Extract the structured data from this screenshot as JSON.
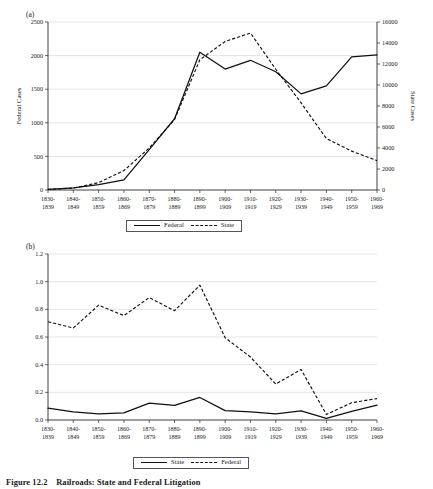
{
  "figure": {
    "caption_number": "Figure 12.2",
    "caption_text": "Railroads: State and Federal Litigation",
    "panel_a_label": "(a)",
    "panel_b_label": "(b)"
  },
  "chart_data": [
    {
      "id": "panel-a",
      "type": "line",
      "title": "",
      "panel": "(a)",
      "xlabel": "",
      "ylabel": "Federal Cases",
      "y2label": "State Cases",
      "grid": true,
      "legend_position": "bottom",
      "categories": [
        "1830-1839",
        "1840-1849",
        "1850-1859",
        "1860-1869",
        "1870-1879",
        "1880-1889",
        "1890-1899",
        "1900-1909",
        "1910-1919",
        "1920-1929",
        "1930-1939",
        "1940-1949",
        "1950-1959",
        "1960-1969"
      ],
      "category_lines": [
        [
          "1830-",
          "1839"
        ],
        [
          "1840-",
          "1849"
        ],
        [
          "1850-",
          "1859"
        ],
        [
          "1860-",
          "1869"
        ],
        [
          "1870-",
          "1879"
        ],
        [
          "1880-",
          "1889"
        ],
        [
          "1890-",
          "1899"
        ],
        [
          "1900-",
          "1909"
        ],
        [
          "1910-",
          "1919"
        ],
        [
          "1920-",
          "1929"
        ],
        [
          "1930-",
          "1939"
        ],
        [
          "1940-",
          "1949"
        ],
        [
          "1950-",
          "1959"
        ],
        [
          "1960-",
          "1969"
        ]
      ],
      "ylim": [
        0,
        2500
      ],
      "yticks": [
        0,
        500,
        1000,
        1500,
        2000,
        2500
      ],
      "ytick_labels": [
        "0",
        "500",
        "1000",
        "1500",
        "2000",
        "2500"
      ],
      "y2lim": [
        0,
        16000
      ],
      "y2ticks": [
        0,
        2000,
        4000,
        6000,
        8000,
        10000,
        12000,
        14000,
        16000
      ],
      "y2tick_labels": [
        "0",
        "2000",
        "4000",
        "6000",
        "8000",
        "10000",
        "12000",
        "14000",
        "16000"
      ],
      "series": [
        {
          "name": "Federal",
          "style": "solid",
          "axis": "left",
          "values": [
            10,
            30,
            80,
            150,
            600,
            1060,
            2050,
            1800,
            1930,
            1760,
            1430,
            1550,
            1980,
            2010
          ]
        },
        {
          "name": "State",
          "style": "dashed",
          "axis": "right",
          "values": [
            60,
            180,
            700,
            1850,
            4000,
            6700,
            12400,
            14150,
            14950,
            11500,
            8300,
            4900,
            3700,
            2800
          ]
        }
      ],
      "legend": [
        {
          "label": "Federal",
          "style": "solid"
        },
        {
          "label": "State",
          "style": "dashed"
        }
      ]
    },
    {
      "id": "panel-b",
      "type": "line",
      "title": "",
      "panel": "(b)",
      "xlabel": "",
      "ylabel": "",
      "grid": true,
      "legend_position": "bottom",
      "categories": [
        "1830-1839",
        "1840-1849",
        "1850-1859",
        "1860-1869",
        "1870-1879",
        "1880-1889",
        "1890-1899",
        "1900-1909",
        "1910-1919",
        "1920-1929",
        "1930-1939",
        "1940-1949",
        "1950-1959",
        "1960-1969"
      ],
      "category_lines": [
        [
          "1830-",
          "1839"
        ],
        [
          "1840-",
          "1849"
        ],
        [
          "1850-",
          "1859"
        ],
        [
          "1860-",
          "1869"
        ],
        [
          "1870-",
          "1879"
        ],
        [
          "1880-",
          "1889"
        ],
        [
          "1890-",
          "1899"
        ],
        [
          "1900-",
          "1909"
        ],
        [
          "1910-",
          "1919"
        ],
        [
          "1920-",
          "1929"
        ],
        [
          "1930-",
          "1939"
        ],
        [
          "1940-",
          "1949"
        ],
        [
          "1950-",
          "1959"
        ],
        [
          "1960-",
          "1969"
        ]
      ],
      "ylim": [
        0,
        1.2
      ],
      "yticks": [
        0.0,
        0.2,
        0.4,
        0.6,
        0.8,
        1.0,
        1.2
      ],
      "ytick_labels": [
        "0.0",
        "0.2",
        "0.4",
        "0.6",
        "0.8",
        "1.0",
        "1.2"
      ],
      "series": [
        {
          "name": "State",
          "style": "solid",
          "values": [
            0.085,
            0.058,
            0.045,
            0.052,
            0.122,
            0.105,
            0.163,
            0.068,
            0.058,
            0.044,
            0.066,
            0.012,
            0.062,
            0.108
          ]
        },
        {
          "name": "Federal",
          "style": "dashed",
          "values": [
            0.71,
            0.665,
            0.83,
            0.755,
            0.885,
            0.79,
            0.975,
            0.595,
            0.455,
            0.26,
            0.365,
            0.04,
            0.125,
            0.155
          ]
        }
      ],
      "legend": [
        {
          "label": "State",
          "style": "solid"
        },
        {
          "label": "Federal",
          "style": "dashed"
        }
      ]
    }
  ],
  "colors": {
    "line": "#111111",
    "grid": "#c9c9c9",
    "axis": "#2a2a2a",
    "text": "#1a1a1a",
    "background": "#ffffff"
  }
}
